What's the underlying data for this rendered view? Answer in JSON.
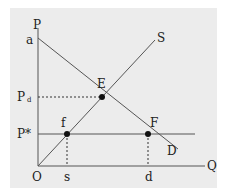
{
  "diagram": {
    "type": "supply-demand",
    "axes": {
      "y_label": "P",
      "x_label": "Q",
      "origin_label": "O"
    },
    "curves": {
      "supply_label": "S",
      "demand_label": "D",
      "demand_intercept_label": "a"
    },
    "points": {
      "equilibrium": "E",
      "supply_at_pstar": "f",
      "demand_at_pstar": "F"
    },
    "price_levels": {
      "pd_main": "P",
      "pd_sub": "d",
      "pstar": "P*"
    },
    "quantities": {
      "qs": "s",
      "qd": "d"
    },
    "colors": {
      "background": "#ececec",
      "line": "#555555",
      "point": "#111111"
    }
  }
}
